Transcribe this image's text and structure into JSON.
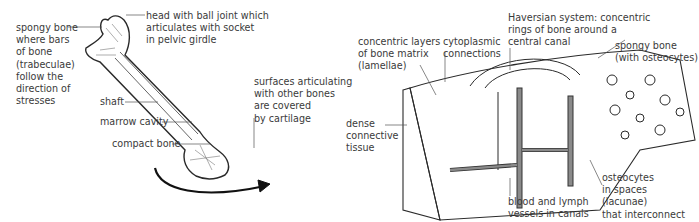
{
  "colors": {
    "line": "#2a2a2a",
    "text": "#3a3a3a",
    "vessel": "#8a8a8a",
    "background": "#ffffff"
  },
  "femur_labels": {
    "spongy_bone": "spongy bone\nwhere bars\nof bone\n(trabeculae)\nfollow the\ndirection of\nstresses",
    "head": "head with ball joint which\narticulates with socket\nin pelvic girdle",
    "shaft": "shaft",
    "marrow": "marrow cavity",
    "compact": "compact bone",
    "surfaces": "surfaces articulating\nwith other bones\nare covered\nby cartilage"
  },
  "tissue_labels": {
    "lamellae": "concentric layers\nof bone matrix\n(lamellae)",
    "cytoplasmic": "cytoplasmic\nconnections",
    "haversian": "Haversian system: concentric\nrings of bone around a\ncentral canal",
    "spongy": "spongy bone\n(with osteocytes)",
    "dense": "dense\nconnective\ntissue",
    "vessels": "blood and lymph\nvessels in canals",
    "osteocytes": "osteocytes\nin spaces\n(lacunae)\nthat interconnect"
  }
}
